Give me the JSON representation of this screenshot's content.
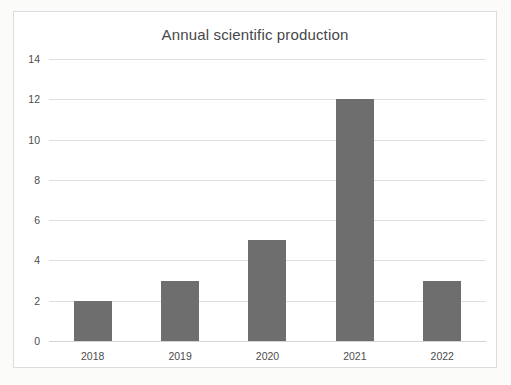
{
  "chart_data": {
    "type": "bar",
    "title": "Annual scientific production",
    "xlabel": "",
    "ylabel": "",
    "categories": [
      "2018",
      "2019",
      "2020",
      "2021",
      "2022"
    ],
    "values": [
      2,
      3,
      5,
      12,
      3
    ],
    "ylim": [
      0,
      14
    ],
    "yticks": [
      0,
      2,
      4,
      6,
      8,
      10,
      12,
      14
    ],
    "ytick_labels": [
      "0",
      "2",
      "4",
      "6",
      "8",
      "10",
      "12",
      "14"
    ],
    "grid": true,
    "grid_axis": "y",
    "legend": false,
    "legend_position": "none",
    "bar_color": "#6e6e6e",
    "grid_color": "#dedede",
    "text_color": "#4c4c4c",
    "title_color": "#45484a",
    "background_color": "#ffffff",
    "frame_color": "#dcdcdc"
  }
}
